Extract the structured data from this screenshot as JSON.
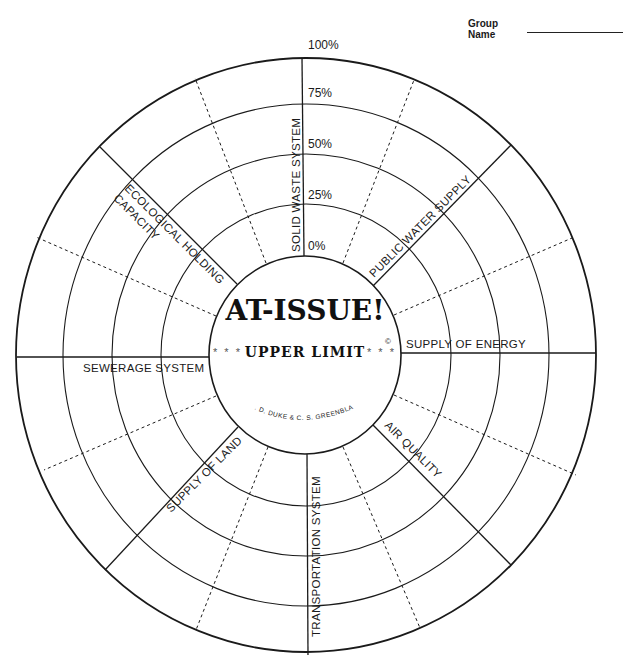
{
  "header": {
    "group_name_label": "Group Name"
  },
  "wheel": {
    "title": "AT-ISSUE!",
    "subtitle": "UPPER LIMIT",
    "stars_left": "* * *",
    "stars_right": "* * *",
    "copyright": "©",
    "credit": "R. D. DUKE & C. S. GREENBLAT",
    "scale_labels": [
      "0%",
      "25%",
      "50%",
      "75%",
      "100%"
    ],
    "sectors": [
      {
        "label": "SOLID WASTE SYSTEM"
      },
      {
        "label": "PUBLIC WATER SUPPLY"
      },
      {
        "label": "SUPPLY OF ENERGY"
      },
      {
        "label": "AIR QUALITY"
      },
      {
        "label": "TRANSPORTATION SYSTEM"
      },
      {
        "label": "SUPPLY OF LAND"
      },
      {
        "label": "SEWERAGE SYSTEM"
      },
      {
        "label": "ECOLOGICAL HOLDING"
      },
      {
        "label": "CAPACITY"
      }
    ]
  },
  "colors": {
    "line": "#1a1a1a",
    "background": "#ffffff"
  }
}
